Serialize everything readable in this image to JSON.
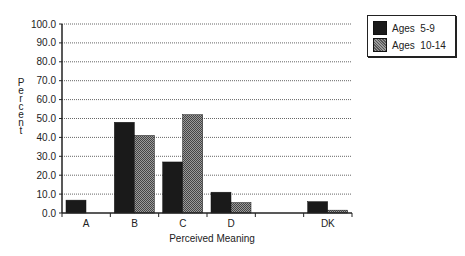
{
  "chart_data": {
    "type": "bar",
    "title": "",
    "xlabel": "Perceived Meaning",
    "ylabel": "Percent",
    "ylim": [
      0,
      100
    ],
    "yticks": [
      "0.0",
      "10.0",
      "20.0",
      "30.0",
      "40.0",
      "50.0",
      "60.0",
      "70.0",
      "80.0",
      "90.0",
      "100.0"
    ],
    "grid": true,
    "legend_position": "top-right",
    "categories": [
      "A",
      "B",
      "C",
      "D",
      "",
      "DK"
    ],
    "series": [
      {
        "name": "Ages  5-9",
        "color": "#1a1a1a",
        "values": [
          6.8,
          48.0,
          27.0,
          11.0,
          0.0,
          6.0
        ]
      },
      {
        "name": "Ages  10-14",
        "color": "#777777",
        "values": [
          0.0,
          41.0,
          52.0,
          5.5,
          0.0,
          1.5
        ]
      }
    ]
  },
  "legend": {
    "items": [
      {
        "label": "Ages  5-9"
      },
      {
        "label": "Ages  10-14"
      }
    ]
  }
}
